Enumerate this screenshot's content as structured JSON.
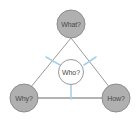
{
  "diagram": {
    "type": "triangle-hub-and-spoke",
    "background_color": "#ffffff",
    "outer_node_fill": "#b0b0b0",
    "outer_node_stroke": "#8c8c8c",
    "center_node_fill": "#ffffff",
    "center_node_stroke": "#9a9a9a",
    "label_color": "#4a4a4a",
    "triangle_edge_color": "#9a9a9a",
    "spoke_color": "#a9cfe8",
    "nodes": {
      "top": {
        "label": "What?",
        "role": "outer"
      },
      "bottom_left": {
        "label": "Why?",
        "role": "outer"
      },
      "bottom_right": {
        "label": "How?",
        "role": "outer"
      },
      "center": {
        "label": "Who?",
        "role": "center"
      }
    },
    "edges": [
      {
        "from": "top",
        "to": "bottom_left",
        "style": "triangle-edge"
      },
      {
        "from": "top",
        "to": "bottom_right",
        "style": "triangle-edge"
      },
      {
        "from": "bottom_left",
        "to": "bottom_right",
        "style": "triangle-edge"
      }
    ],
    "spokes": [
      {
        "from": "center",
        "to": "left-edge",
        "style": "spoke"
      },
      {
        "from": "center",
        "to": "right-edge",
        "style": "spoke"
      },
      {
        "from": "center",
        "to": "bottom-edge",
        "style": "spoke"
      }
    ]
  }
}
